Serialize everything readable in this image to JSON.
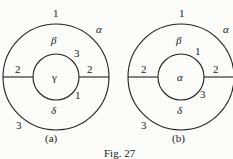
{
  "figure": {
    "caption": "Fig. 27",
    "panels": [
      {
        "label": "(a)",
        "outer_region": "α",
        "upper_region": "β",
        "inner_region": "γ",
        "lower_region": "δ",
        "edge_labels": {
          "top": "1",
          "left": "2",
          "right": "2",
          "bottom_left": "3",
          "inner_upper_right": "3",
          "inner_lower_right": "1"
        }
      },
      {
        "label": "(b)",
        "outer_region": "α",
        "upper_region": "β",
        "inner_region": "α",
        "lower_region": "δ",
        "edge_labels": {
          "top": "1",
          "left": "2",
          "right": "2",
          "bottom_left": "3",
          "inner_upper_right": "1",
          "inner_lower_right": "3"
        }
      }
    ]
  }
}
